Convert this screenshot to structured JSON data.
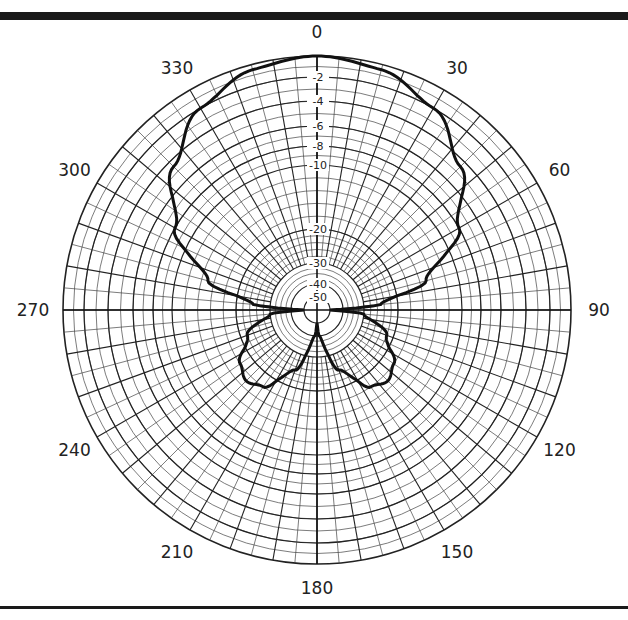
{
  "chart_data": {
    "type": "polar-line",
    "title": "",
    "angle_unit": "degrees",
    "angle_direction": "clockwise",
    "zero_location": "top",
    "angle_labels": [
      "0",
      "30",
      "60",
      "90",
      "120",
      "150",
      "180",
      "210",
      "240",
      "270",
      "300",
      "330"
    ],
    "angle_label_values": [
      0,
      30,
      60,
      90,
      120,
      150,
      180,
      210,
      240,
      270,
      300,
      330
    ],
    "radial_unit": "dB",
    "radial_labels": [
      "-2",
      "-4",
      "-6",
      "-8",
      "-10",
      "-20",
      "-30",
      "-40",
      "-50"
    ],
    "radial_rings": [
      {
        "db": 0,
        "r": 254
      },
      {
        "db": -2,
        "r": 233
      },
      {
        "db": -4,
        "r": 209
      },
      {
        "db": -6,
        "r": 184
      },
      {
        "db": -8,
        "r": 164
      },
      {
        "db": -10,
        "r": 145
      },
      {
        "db": -20,
        "r": 81
      },
      {
        "db": -30,
        "r": 47
      },
      {
        "db": -40,
        "r": 26
      },
      {
        "db": -50,
        "r": 13
      }
    ],
    "grid": true,
    "legend": null,
    "series": [
      {
        "name": "radiation pattern",
        "angles": [
          0,
          15,
          30,
          45,
          60,
          75,
          85,
          90,
          95,
          110,
          125,
          135,
          145,
          160,
          175,
          180,
          185,
          200,
          215,
          225,
          235,
          250,
          265,
          270,
          275,
          285,
          300,
          315,
          330,
          345,
          360
        ],
        "values_db": [
          0,
          -0.5,
          -2,
          -4.5,
          -8,
          -15,
          -25,
          -50,
          -30,
          -22,
          -18,
          -17,
          -18,
          -25,
          -40,
          -50,
          -40,
          -25,
          -18,
          -17,
          -18,
          -22,
          -30,
          -50,
          -25,
          -15,
          -8,
          -4.5,
          -2,
          -0.5,
          0
        ]
      }
    ]
  }
}
